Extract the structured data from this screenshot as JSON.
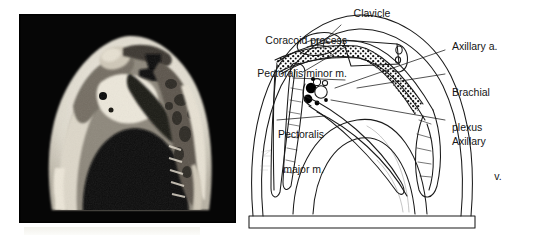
{
  "figure": {
    "kind": "anatomy-figure",
    "panels": [
      "mri-axial-scan",
      "labeled-line-drawing"
    ],
    "background_color": "#ffffff",
    "ink_color": "#1a1a1a"
  },
  "mri": {
    "alt_name": "axial-mri-axilla",
    "background_color": "#050505",
    "bright_tissue_color": "#f2efe6",
    "mid_tissue_color": "#9b958a",
    "dark_tissue_color": "#3a3731"
  },
  "diagram": {
    "name": "axilla-line-drawing",
    "stroke_color": "#1a1a1a",
    "vessel_fill_color": "#000000"
  },
  "labels": {
    "clavicle": "Clavicle",
    "coracoid_process": "Coracoid process",
    "pectoralis_minor": "Pectoralis minor m.",
    "pectoralis_major_line1": "Pectoralis",
    "pectoralis_major_line2": "major m.",
    "axillary_artery": "Axillary a.",
    "brachial_plexus_line1": "Brachial",
    "brachial_plexus_line2": "plexus",
    "axillary_vein_line1": "Axillary",
    "axillary_vein_line2": "v."
  }
}
